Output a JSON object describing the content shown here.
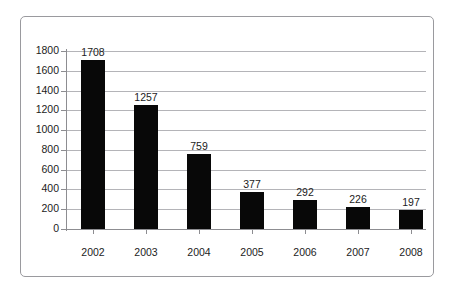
{
  "chart_data": {
    "type": "bar",
    "title": "",
    "subtitle": "",
    "xlabel": "",
    "ylabel": "",
    "categories": [
      "2002",
      "2003",
      "2004",
      "2005",
      "2006",
      "2007",
      "2008"
    ],
    "values": [
      1708,
      1257,
      759,
      377,
      292,
      226,
      197
    ],
    "data_labels": [
      "1708",
      "1257",
      "759",
      "377",
      "292",
      "226",
      "197"
    ],
    "ylim": [
      0,
      1800
    ],
    "ytick_step": 200,
    "ytick_labels": [
      "0",
      "200",
      "400",
      "600",
      "800",
      "1000",
      "1200",
      "1400",
      "1600",
      "1800"
    ],
    "ytick_values": [
      0,
      200,
      400,
      600,
      800,
      1000,
      1200,
      1400,
      1600,
      1800
    ],
    "grid": true,
    "grid_axis": "y",
    "legend": false,
    "legend_position": "none",
    "series": [
      {
        "name": "",
        "values": [
          1708,
          1257,
          759,
          377,
          292,
          226,
          197
        ]
      }
    ],
    "colors": {
      "bar": "#080808",
      "gridline": "#b4b4b8",
      "axis": "#8d8d91",
      "text": "#1c1c1c",
      "frame_border": "#9a9a9e",
      "background": "#ffffff"
    }
  }
}
